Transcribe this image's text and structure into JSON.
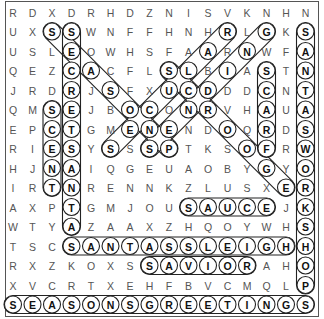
{
  "puzzle": {
    "rows": 16,
    "cols": 16,
    "grid": [
      "RDXDRHDZNISVKNHN",
      "UXSSWNFFHNHRLGKS",
      "USLEOWHSFAARNWFA",
      "QEZCACFLSLBIASTN",
      "JRDRJSFXUCDDDCNT",
      "QMSEJBOCONRVHAUA",
      "EPCTGMENENDOQRDS",
      "RIESYSSSPTKSOFRW",
      "HJNAIQGEUAOBYGYO",
      "IRTNRENNKZLUSXER",
      "AXPTGMJOUSAUCEJK",
      "WTYAZAAXZHQOYWHS",
      "TSCSANTASSLEIGHH",
      "RXZKOXSSAVIORAHO",
      "XVCRTXEHFBVCMQLP",
      "SEASONSGREETINGS"
    ],
    "found_words": [
      {
        "word": "SEASONSGREETINGS",
        "start": [
          15,
          0
        ],
        "end": [
          15,
          15
        ]
      },
      {
        "word": "SANTASSLEIGH",
        "start": [
          12,
          3
        ],
        "end": [
          12,
          14
        ]
      },
      {
        "word": "SAVIOR",
        "start": [
          13,
          7
        ],
        "end": [
          13,
          12
        ]
      },
      {
        "word": "SAUCE",
        "start": [
          10,
          9
        ],
        "end": [
          10,
          13
        ]
      },
      {
        "word": "SANTASWORKSHOP",
        "start": [
          1,
          15
        ],
        "end": [
          14,
          15
        ]
      },
      {
        "word": "SECRETSANTA",
        "start": [
          1,
          3
        ],
        "end": [
          11,
          3
        ]
      },
      {
        "word": "SCENT",
        "start": [
          5,
          2
        ],
        "end": [
          9,
          2
        ]
      },
      {
        "word": "SCARF",
        "start": [
          3,
          13
        ],
        "end": [
          7,
          13
        ]
      },
      {
        "word": "SEASONS",
        "start": [
          1,
          2
        ],
        "end": [
          7,
          8
        ]
      },
      {
        "word": "SECULAR",
        "start": [
          7,
          5
        ],
        "end": [
          1,
          11
        ]
      },
      {
        "word": "SENDING",
        "start": [
          7,
          7
        ],
        "end": [
          1,
          13
        ]
      },
      {
        "word": "SCROOGE",
        "start": [
          3,
          8
        ],
        "end": [
          9,
          14
        ]
      }
    ],
    "colors": {
      "letter": "#555555",
      "found_letter": "#111111",
      "outline": "#222222",
      "background": "#ffffff"
    }
  }
}
